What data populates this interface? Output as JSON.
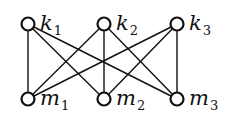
{
  "diagram": {
    "type": "complete bipartite graph K3,3",
    "top_nodes": [
      {
        "id": "k1",
        "base": "k",
        "sub": "1",
        "x": 28,
        "y": 24
      },
      {
        "id": "k2",
        "base": "k",
        "sub": "2",
        "x": 104,
        "y": 24
      },
      {
        "id": "k3",
        "base": "k",
        "sub": "3",
        "x": 177,
        "y": 24
      }
    ],
    "bottom_nodes": [
      {
        "id": "m1",
        "base": "m",
        "sub": "1",
        "x": 28,
        "y": 99
      },
      {
        "id": "m2",
        "base": "m",
        "sub": "2",
        "x": 104,
        "y": 99
      },
      {
        "id": "m3",
        "base": "m",
        "sub": "3",
        "x": 177,
        "y": 99
      }
    ],
    "edges": [
      [
        "k1",
        "m1"
      ],
      [
        "k1",
        "m2"
      ],
      [
        "k1",
        "m3"
      ],
      [
        "k2",
        "m1"
      ],
      [
        "k2",
        "m2"
      ],
      [
        "k2",
        "m3"
      ],
      [
        "k3",
        "m1"
      ],
      [
        "k3",
        "m2"
      ],
      [
        "k3",
        "m3"
      ]
    ],
    "colors": {
      "stroke": "#111111",
      "background": "#ffffff"
    }
  }
}
